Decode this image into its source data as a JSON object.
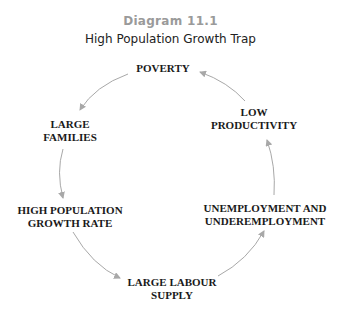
{
  "caption": {
    "number": "Diagram 11.1",
    "title": "High Population Growth Trap"
  },
  "nodes": [
    {
      "id": "poverty",
      "lines": [
        "POVERTY"
      ]
    },
    {
      "id": "large-families",
      "lines": [
        "LARGE",
        "FAMILIES"
      ]
    },
    {
      "id": "high-population-growth-rate",
      "lines": [
        "HIGH POPULATION",
        "GROWTH RATE"
      ]
    },
    {
      "id": "large-labour-supply",
      "lines": [
        "LARGE LABOUR",
        "SUPPLY"
      ]
    },
    {
      "id": "unemployment",
      "lines": [
        "UNEMPLOYMENT AND",
        "UNDEREMPLOYMENT"
      ]
    },
    {
      "id": "low-productivity",
      "lines": [
        "LOW",
        "PRODUCTIVITY"
      ]
    }
  ],
  "edges": [
    {
      "from": "poverty",
      "to": "large-families"
    },
    {
      "from": "large-families",
      "to": "high-population-growth-rate"
    },
    {
      "from": "high-population-growth-rate",
      "to": "large-labour-supply"
    },
    {
      "from": "large-labour-supply",
      "to": "unemployment"
    },
    {
      "from": "unemployment",
      "to": "low-productivity"
    },
    {
      "from": "low-productivity",
      "to": "poverty"
    }
  ],
  "colors": {
    "arrow": "#a8a8a8",
    "caption_number": "#9a9a9a",
    "text": "#1a1a1a"
  }
}
